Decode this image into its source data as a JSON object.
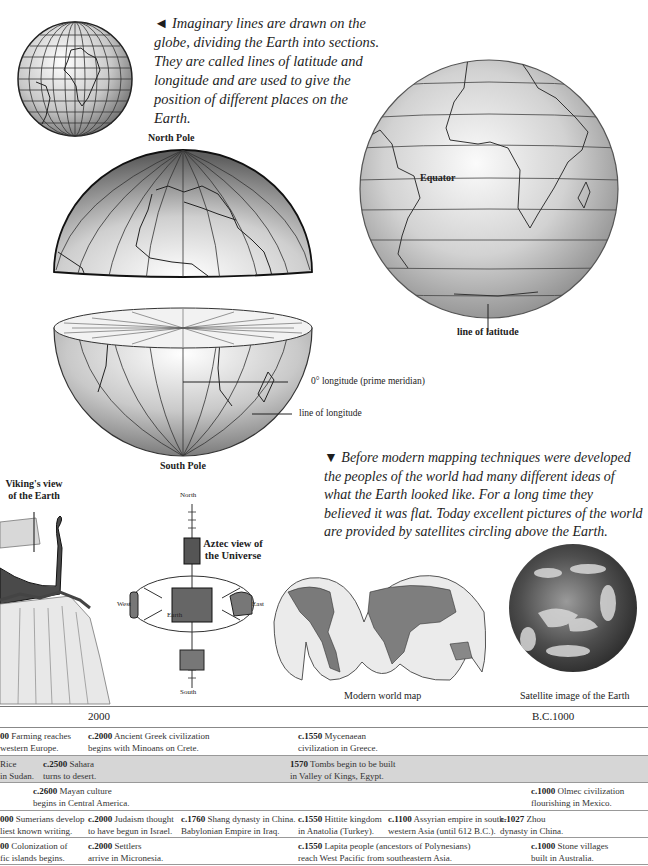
{
  "captions": {
    "lines_intro": [
      "◄ Imaginary lines are drawn on the",
      "globe, dividing the Earth into sections.",
      "They are called lines of latitude and",
      "longitude and are used to give the",
      "position of different places on the Earth."
    ],
    "mapping_intro": [
      "▼ Before modern mapping techniques were developed",
      "the peoples of the world had many different ideas of",
      "what the Earth looked like. For a long time they",
      "believed it was flat. Today excellent pictures of the world",
      "are provided by satellites circling above the Earth."
    ]
  },
  "labels": {
    "north_pole": "North Pole",
    "south_pole": "South Pole",
    "equator": "Equator",
    "line_of_latitude": "line of latitude",
    "prime_meridian": "0° longitude (prime meridian)",
    "line_of_longitude": "line of longitude",
    "viking_view": [
      "Viking's view",
      "of the Earth"
    ],
    "aztec_view": [
      "Aztec view of",
      "the Universe"
    ],
    "aztec_north": "North",
    "aztec_south": "South",
    "aztec_west": "West",
    "aztec_east": "East",
    "aztec_earth": "Earth",
    "modern_map": "Modern world map",
    "satellite_image": "Satellite image of the Earth"
  },
  "timeline": {
    "header": {
      "left": "2000",
      "right": "B.C.1000"
    },
    "rows": [
      {
        "shaded": false,
        "cells": [
          {
            "bold": "00",
            "text": " Farming reaches",
            "line2": "western Europe."
          },
          {
            "bold": "c.2000",
            "text": " Ancient Greek civilization",
            "line2": "begins with Minoans on Crete."
          },
          {
            "bold": "c.1550",
            "text": " Mycenaean",
            "line2": "civilization in Greece."
          }
        ]
      },
      {
        "shaded": true,
        "cells": [
          {
            "bold": "",
            "text": "Rice",
            "line2": "in Sudan."
          },
          {
            "bold": "c.2500",
            "text": " Sahara",
            "line2": "turns to desert."
          },
          {
            "bold": "1570",
            "text": " Tombs begin to be built",
            "line2": "in Valley of Kings, Egypt."
          }
        ]
      },
      {
        "shaded": false,
        "cells": [
          {
            "bold": "c.2600",
            "text": " Mayan culture",
            "line2": "begins in Central America."
          },
          {
            "bold": "c.1000",
            "text": " Olmec civilization",
            "line2": "flourishing in Mexico."
          }
        ]
      },
      {
        "shaded": false,
        "cells": [
          {
            "bold": "000",
            "text": " Sumerians develop",
            "line2": "liest known writing."
          },
          {
            "bold": "c.2000",
            "text": " Judaism thought",
            "line2": "to have begun in Israel."
          },
          {
            "bold": "c.1760",
            "text": " Shang dynasty in China.",
            "line2": "Babylonian Empire in Iraq."
          },
          {
            "bold": "c.1550",
            "text": " Hittite kingdom",
            "line2": "in Anatolia (Turkey)."
          },
          {
            "bold": "c.1100",
            "text": " Assyrian empire in south-",
            "line2": "western Asia (until 612 B.C.)."
          },
          {
            "bold": "c.1027",
            "text": " Zhou",
            "line2": "dynasty in China."
          }
        ]
      },
      {
        "shaded": false,
        "cells": [
          {
            "bold": "00",
            "text": " Colonization of",
            "line2": "fic islands begins."
          },
          {
            "bold": "c.2000",
            "text": " Settlers",
            "line2": "arrive in Micronesia."
          },
          {
            "bold": "c.1550",
            "text": " Lapita people (ancestors of Polynesians)",
            "line2": "reach West Pacific from southeastern Asia."
          },
          {
            "bold": "c.1000",
            "text": " Stone villages",
            "line2": "built in Australia."
          }
        ]
      }
    ]
  }
}
